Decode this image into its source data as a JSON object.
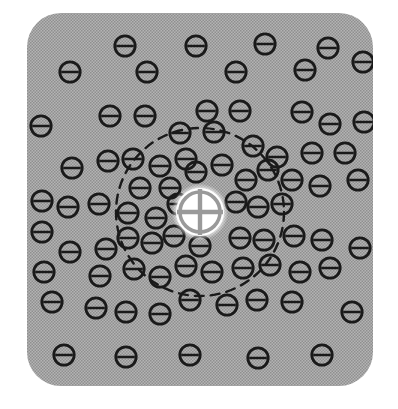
{
  "figure": {
    "type": "physics-schematic",
    "canvas": {
      "width": 398,
      "height": 409,
      "background": "#ffffff"
    },
    "panel": {
      "name": "plasma-medium",
      "x": 27,
      "y": 13,
      "width": 346,
      "height": 373,
      "corner_radius": 34,
      "fill": "#a8a8a8",
      "texture": "halftone-dot-screen",
      "texture_dot_color": "#8c8c8c"
    },
    "positive_charge": {
      "label": "+",
      "name": "positive-test-charge",
      "cx": 200,
      "cy": 212,
      "radius": 24,
      "fill": "#ffffff",
      "glyph_color": "#9a9a9a",
      "description": "white disc with a cross (plus) symbol"
    },
    "debye_sphere": {
      "name": "debye-radius-boundary",
      "cx": 200,
      "cy": 212,
      "radius": 84,
      "stroke": "#1a1a1a",
      "stroke_width": 2.4,
      "dash": "9 7",
      "style": "dashed"
    },
    "negative_charge_style": {
      "label": "−",
      "radius": 10.2,
      "stroke": "#1a1a1a",
      "stroke_width": 2.8,
      "bar_width": 2.6,
      "fill": "none",
      "description": "circle with a horizontal bar (minus sign)"
    },
    "negative_charges": [
      {
        "cx": 125,
        "cy": 46
      },
      {
        "cx": 196,
        "cy": 46
      },
      {
        "cx": 265,
        "cy": 44
      },
      {
        "cx": 328,
        "cy": 48
      },
      {
        "cx": 70,
        "cy": 72
      },
      {
        "cx": 147,
        "cy": 72
      },
      {
        "cx": 236,
        "cy": 72
      },
      {
        "cx": 305,
        "cy": 70
      },
      {
        "cx": 363,
        "cy": 62
      },
      {
        "cx": 41,
        "cy": 126
      },
      {
        "cx": 110,
        "cy": 116
      },
      {
        "cx": 145,
        "cy": 116
      },
      {
        "cx": 207,
        "cy": 111
      },
      {
        "cx": 240,
        "cy": 111
      },
      {
        "cx": 302,
        "cy": 112
      },
      {
        "cx": 330,
        "cy": 124
      },
      {
        "cx": 364,
        "cy": 122
      },
      {
        "cx": 72,
        "cy": 168
      },
      {
        "cx": 108,
        "cy": 161
      },
      {
        "cx": 180,
        "cy": 133
      },
      {
        "cx": 214,
        "cy": 132
      },
      {
        "cx": 253,
        "cy": 146
      },
      {
        "cx": 277,
        "cy": 157
      },
      {
        "cx": 312,
        "cy": 153
      },
      {
        "cx": 345,
        "cy": 153
      },
      {
        "cx": 42,
        "cy": 201
      },
      {
        "cx": 68,
        "cy": 207
      },
      {
        "cx": 99,
        "cy": 204
      },
      {
        "cx": 133,
        "cy": 159
      },
      {
        "cx": 160,
        "cy": 166
      },
      {
        "cx": 186,
        "cy": 159
      },
      {
        "cx": 246,
        "cy": 180
      },
      {
        "cx": 268,
        "cy": 170
      },
      {
        "cx": 292,
        "cy": 180
      },
      {
        "cx": 320,
        "cy": 186
      },
      {
        "cx": 358,
        "cy": 180
      },
      {
        "cx": 140,
        "cy": 188
      },
      {
        "cx": 170,
        "cy": 188
      },
      {
        "cx": 196,
        "cy": 172
      },
      {
        "cx": 222,
        "cy": 165
      },
      {
        "cx": 236,
        "cy": 202
      },
      {
        "cx": 258,
        "cy": 207
      },
      {
        "cx": 282,
        "cy": 204
      },
      {
        "cx": 128,
        "cy": 213
      },
      {
        "cx": 156,
        "cy": 218
      },
      {
        "cx": 178,
        "cy": 204
      },
      {
        "cx": 42,
        "cy": 232
      },
      {
        "cx": 70,
        "cy": 252
      },
      {
        "cx": 106,
        "cy": 249
      },
      {
        "cx": 128,
        "cy": 238
      },
      {
        "cx": 152,
        "cy": 243
      },
      {
        "cx": 174,
        "cy": 236
      },
      {
        "cx": 200,
        "cy": 246
      },
      {
        "cx": 240,
        "cy": 238
      },
      {
        "cx": 264,
        "cy": 240
      },
      {
        "cx": 294,
        "cy": 236
      },
      {
        "cx": 322,
        "cy": 240
      },
      {
        "cx": 360,
        "cy": 248
      },
      {
        "cx": 44,
        "cy": 272
      },
      {
        "cx": 100,
        "cy": 276
      },
      {
        "cx": 134,
        "cy": 269
      },
      {
        "cx": 160,
        "cy": 277
      },
      {
        "cx": 186,
        "cy": 266
      },
      {
        "cx": 212,
        "cy": 272
      },
      {
        "cx": 243,
        "cy": 268
      },
      {
        "cx": 270,
        "cy": 265
      },
      {
        "cx": 300,
        "cy": 272
      },
      {
        "cx": 330,
        "cy": 268
      },
      {
        "cx": 52,
        "cy": 302
      },
      {
        "cx": 96,
        "cy": 308
      },
      {
        "cx": 126,
        "cy": 312
      },
      {
        "cx": 160,
        "cy": 314
      },
      {
        "cx": 190,
        "cy": 300
      },
      {
        "cx": 227,
        "cy": 305
      },
      {
        "cx": 257,
        "cy": 300
      },
      {
        "cx": 292,
        "cy": 302
      },
      {
        "cx": 352,
        "cy": 312
      },
      {
        "cx": 64,
        "cy": 355
      },
      {
        "cx": 126,
        "cy": 357
      },
      {
        "cx": 190,
        "cy": 355
      },
      {
        "cx": 258,
        "cy": 358
      },
      {
        "cx": 322,
        "cy": 355
      }
    ]
  }
}
